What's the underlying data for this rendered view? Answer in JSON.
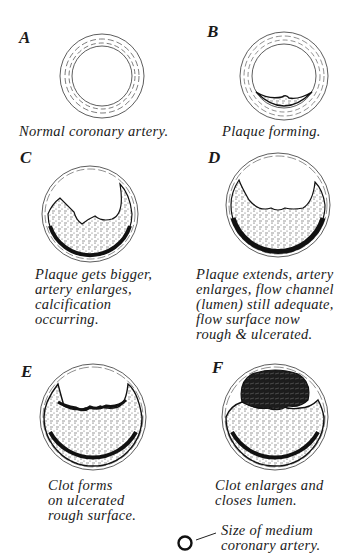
{
  "diagram": {
    "panels": [
      {
        "id": "A",
        "caption": [
          "Normal coronary artery."
        ]
      },
      {
        "id": "B",
        "caption": [
          "Plaque forming."
        ]
      },
      {
        "id": "C",
        "caption": [
          "Plaque gets bigger,",
          "artery enlarges,",
          "calcification",
          "occurring."
        ]
      },
      {
        "id": "D",
        "caption": [
          "Plaque extends, artery",
          "enlarges, flow channel",
          "(lumen) still adequate,",
          "flow surface now",
          "rough & ulcerated."
        ]
      },
      {
        "id": "E",
        "caption": [
          "Clot forms",
          "on ulcerated",
          "rough surface."
        ]
      },
      {
        "id": "F",
        "caption": [
          "Clot enlarges and",
          "closes lumen."
        ]
      }
    ],
    "legend": {
      "symbol": "small-circle",
      "text": [
        "Size of medium",
        "coronary artery."
      ]
    },
    "colors": {
      "ink": "#1a1a1a",
      "background": "#ffffff"
    }
  }
}
